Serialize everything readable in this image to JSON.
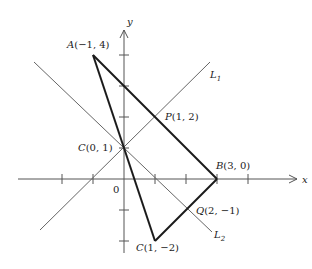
{
  "diagram": {
    "axes": {
      "x_label": "x",
      "y_label": "y",
      "origin_label": "0",
      "x_ticks": [
        -3,
        -2,
        -1,
        1,
        2,
        3,
        4
      ],
      "y_ticks": [
        -3,
        -2,
        -1,
        1,
        2,
        3,
        4
      ]
    },
    "points": {
      "A": {
        "name": "A",
        "coords": "(−1, 4)",
        "x": -1,
        "y": 4
      },
      "B": {
        "name": "B",
        "coords": "(3, 0)",
        "x": 3,
        "y": 0
      },
      "C_top": {
        "name": "C",
        "coords": "(0, 1)",
        "x": 0,
        "y": 1
      },
      "C_bottom": {
        "name": "C",
        "coords": "(1, −2)",
        "x": 1,
        "y": -2
      },
      "P": {
        "name": "P",
        "coords": "(1, 2)",
        "x": 1,
        "y": 2
      },
      "Q": {
        "name": "Q",
        "coords": "(2, −1)",
        "x": 2,
        "y": -1
      }
    },
    "lines": {
      "L1": {
        "name": "L",
        "subscript": "1",
        "equation": "y = x + 1"
      },
      "L2": {
        "name": "L",
        "subscript": "2",
        "equation": "y = -x + 1"
      }
    },
    "segments": [
      "A-B",
      "A-C(1,-2)",
      "C(1,-2)-B"
    ],
    "colors": {
      "axis": "#555555",
      "thin_line": "#666666",
      "thick_line": "#1a1a1a",
      "text": "#222222"
    }
  }
}
